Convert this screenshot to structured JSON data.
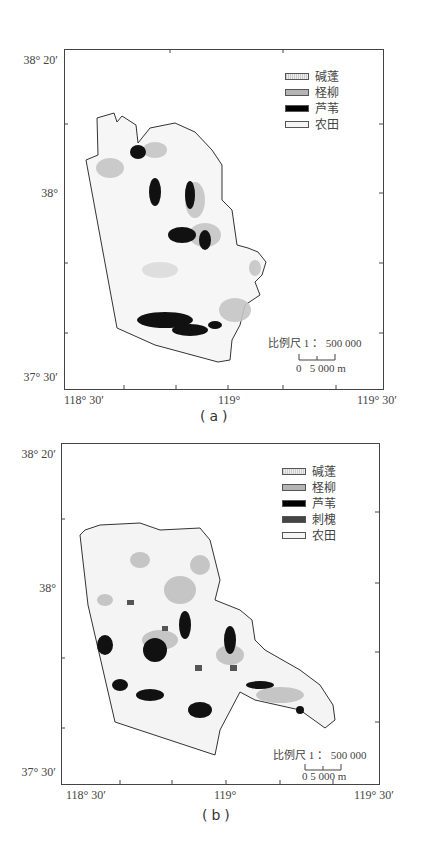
{
  "figure_type": "vegetation distribution maps",
  "panels": [
    {
      "caption": "(a)",
      "lat_labels": [
        "38° 20′",
        "38°",
        "37° 30′"
      ],
      "lon_labels": [
        "118° 30′",
        "119°",
        "119° 30′"
      ],
      "legend": [
        {
          "label": "碱蓬",
          "color": "#d6d6d6",
          "pattern": "hatched"
        },
        {
          "label": "柽柳",
          "color": "#b4b4b4"
        },
        {
          "label": "芦苇",
          "color": "#000000"
        },
        {
          "label": "农田",
          "color": "#f4f4f4"
        }
      ],
      "scale_text": "比例尺 1 ： 500 000",
      "scale_bar_label": "0   5 000 m"
    },
    {
      "caption": "(b)",
      "lat_labels": [
        "38° 20′",
        "38°",
        "37° 30′"
      ],
      "lon_labels": [
        "118° 30′",
        "119°",
        "119° 30′"
      ],
      "legend": [
        {
          "label": "碱蓬",
          "color": "#d6d6d6",
          "pattern": "hatched"
        },
        {
          "label": "柽柳",
          "color": "#b4b4b4"
        },
        {
          "label": "芦苇",
          "color": "#000000"
        },
        {
          "label": "刺槐",
          "color": "#444444"
        },
        {
          "label": "农田",
          "color": "#f4f4f4"
        }
      ],
      "scale_text": "比例尺 1 ： 500 000",
      "scale_bar_label": "0 5 000 m"
    }
  ]
}
